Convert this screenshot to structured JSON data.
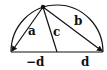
{
  "diagram": {
    "type": "semicircle-geometry",
    "labels": {
      "a": "a",
      "b": "b",
      "c": "c",
      "left_endpoint": "−d",
      "right_endpoint": "d"
    },
    "colors": {
      "stroke": "#111111",
      "background": "#ffffff"
    }
  }
}
